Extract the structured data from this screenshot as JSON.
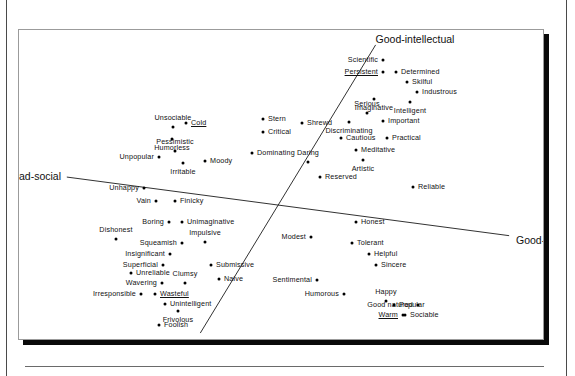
{
  "figure": {
    "kind": "multidimensional-scaling-scatter",
    "axis_labels": {
      "good_intellectual": "Good-intellectual",
      "bad_intellectual": "Bad-intellectual",
      "good_social": "Good-social",
      "bad_social": "Bad-social"
    }
  },
  "chart_data": {
    "type": "scatter",
    "title": "",
    "subtitle": "",
    "xlabel": "",
    "ylabel": "",
    "grid": false,
    "legend": "none",
    "xlim": [
      0,
      526
    ],
    "ylim": [
      0,
      311
    ],
    "note": "Two oblique reference axes are drawn: a social axis running from Bad-social (upper left) to Good-social (lower right), and an intellectual axis running from Good-intellectual (upper right) to Bad-intellectual (lower left). Coordinates below are plot-box pixel positions of each labelled trait dot.",
    "axes": [
      {
        "name": "social-axis",
        "negative_label": "Bad-social",
        "positive_label": "Good-social",
        "x1": 48,
        "y1": 148,
        "x2": 492,
        "y2": 207
      },
      {
        "name": "intellectual-axis",
        "negative_label": "Bad-intellectual",
        "positive_label": "Good-intellectual",
        "x1": 182,
        "y1": 305,
        "x2": 358,
        "y2": 15
      }
    ],
    "axis_end_labels": [
      {
        "name": "Good-intellectual",
        "x": 396,
        "y": 9,
        "align": "ctr-x"
      },
      {
        "name": "Bad-social",
        "x": 42,
        "y": 146,
        "align": "end-l"
      },
      {
        "name": "Good-social",
        "x": 497,
        "y": 210,
        "align": "end-r"
      },
      {
        "name": "Bad-intellectual",
        "x": 176,
        "y": 313,
        "align": "ctr-x"
      }
    ],
    "points": [
      {
        "label": "Scientific",
        "x": 364,
        "y": 30,
        "pos": "right",
        "underline": false
      },
      {
        "label": "Persistent",
        "x": 364,
        "y": 42,
        "pos": "right",
        "underline": true
      },
      {
        "label": "Determined",
        "x": 377,
        "y": 42,
        "pos": "left",
        "underline": false
      },
      {
        "label": "Skilful",
        "x": 388,
        "y": 52,
        "pos": "left",
        "underline": false
      },
      {
        "label": "Industrous",
        "x": 398,
        "y": 62,
        "pos": "left",
        "underline": false
      },
      {
        "label": "Imaginative",
        "x": 355,
        "y": 69,
        "pos": "below",
        "underline": false
      },
      {
        "label": "Intelligent",
        "x": 391,
        "y": 72,
        "pos": "below",
        "underline": false
      },
      {
        "label": "Serious",
        "x": 348,
        "y": 83,
        "pos": "above",
        "underline": false
      },
      {
        "label": "Important",
        "x": 364,
        "y": 91,
        "pos": "left",
        "underline": false
      },
      {
        "label": "Discriminating",
        "x": 330,
        "y": 92,
        "pos": "below",
        "underline": false
      },
      {
        "label": "Cautious",
        "x": 322,
        "y": 108,
        "pos": "left",
        "underline": false
      },
      {
        "label": "Practical",
        "x": 368,
        "y": 108,
        "pos": "left",
        "underline": false
      },
      {
        "label": "Meditative",
        "x": 337,
        "y": 120,
        "pos": "left",
        "underline": false
      },
      {
        "label": "Artistic",
        "x": 344,
        "y": 130,
        "pos": "below",
        "underline": false
      },
      {
        "label": "Reserved",
        "x": 301,
        "y": 147,
        "pos": "left",
        "underline": false
      },
      {
        "label": "Reliable",
        "x": 394,
        "y": 157,
        "pos": "left",
        "underline": false
      },
      {
        "label": "Stern",
        "x": 244,
        "y": 89,
        "pos": "left",
        "underline": false
      },
      {
        "label": "Shrewd",
        "x": 283,
        "y": 93,
        "pos": "left",
        "underline": false
      },
      {
        "label": "Critical",
        "x": 244,
        "y": 102,
        "pos": "left",
        "underline": false
      },
      {
        "label": "Dominating",
        "x": 233,
        "y": 123,
        "pos": "left",
        "underline": false
      },
      {
        "label": "Daring",
        "x": 289,
        "y": 132,
        "pos": "above",
        "underline": false
      },
      {
        "label": "Unsociable",
        "x": 154,
        "y": 97,
        "pos": "above",
        "underline": false
      },
      {
        "label": "Cold",
        "x": 167,
        "y": 93,
        "pos": "left",
        "underline": true
      },
      {
        "label": "Humorless",
        "x": 153,
        "y": 109,
        "pos": "below",
        "underline": false
      },
      {
        "label": "Pessimistic",
        "x": 156,
        "y": 121,
        "pos": "above",
        "underline": false
      },
      {
        "label": "Unpopular",
        "x": 140,
        "y": 127,
        "pos": "right",
        "underline": false
      },
      {
        "label": "Irritable",
        "x": 164,
        "y": 133,
        "pos": "below",
        "underline": false
      },
      {
        "label": "Moody",
        "x": 186,
        "y": 131,
        "pos": "left",
        "underline": false
      },
      {
        "label": "Unhappy",
        "x": 125,
        "y": 158,
        "pos": "right",
        "underline": false
      },
      {
        "label": "Vain",
        "x": 137,
        "y": 171,
        "pos": "right",
        "underline": false
      },
      {
        "label": "Finicky",
        "x": 156,
        "y": 171,
        "pos": "left",
        "underline": false
      },
      {
        "label": "Boring",
        "x": 150,
        "y": 192,
        "pos": "right",
        "underline": false
      },
      {
        "label": "Unimaginative",
        "x": 163,
        "y": 192,
        "pos": "left",
        "underline": false
      },
      {
        "label": "Dishonest",
        "x": 97,
        "y": 209,
        "pos": "above",
        "underline": false
      },
      {
        "label": "Squeamish",
        "x": 163,
        "y": 213,
        "pos": "right",
        "underline": false
      },
      {
        "label": "Impulsive",
        "x": 186,
        "y": 212,
        "pos": "above",
        "underline": false
      },
      {
        "label": "Insignificant",
        "x": 151,
        "y": 224,
        "pos": "right",
        "underline": false
      },
      {
        "label": "Superficial",
        "x": 144,
        "y": 235,
        "pos": "right",
        "underline": false
      },
      {
        "label": "Submissive",
        "x": 192,
        "y": 235,
        "pos": "left",
        "underline": false
      },
      {
        "label": "Unreliable",
        "x": 112,
        "y": 243,
        "pos": "left",
        "underline": false
      },
      {
        "label": "Clumsy",
        "x": 166,
        "y": 253,
        "pos": "above",
        "underline": false
      },
      {
        "label": "Wavering",
        "x": 143,
        "y": 253,
        "pos": "right",
        "underline": false
      },
      {
        "label": "Naive",
        "x": 200,
        "y": 249,
        "pos": "left",
        "underline": false
      },
      {
        "label": "Irresponsible",
        "x": 122,
        "y": 264,
        "pos": "right",
        "underline": false
      },
      {
        "label": "Wasteful",
        "x": 136,
        "y": 264,
        "pos": "left",
        "underline": true
      },
      {
        "label": "Unintelligent",
        "x": 146,
        "y": 274,
        "pos": "left",
        "underline": false
      },
      {
        "label": "Frivolous",
        "x": 159,
        "y": 281,
        "pos": "below",
        "underline": false
      },
      {
        "label": "Foolish",
        "x": 140,
        "y": 295,
        "pos": "left",
        "underline": false
      },
      {
        "label": "Honest",
        "x": 337,
        "y": 192,
        "pos": "left",
        "underline": false
      },
      {
        "label": "Modest",
        "x": 292,
        "y": 207,
        "pos": "right",
        "underline": false
      },
      {
        "label": "Tolerant",
        "x": 333,
        "y": 213,
        "pos": "left",
        "underline": false
      },
      {
        "label": "Helpful",
        "x": 350,
        "y": 224,
        "pos": "left",
        "underline": false
      },
      {
        "label": "Sincere",
        "x": 357,
        "y": 235,
        "pos": "left",
        "underline": false
      },
      {
        "label": "Sentimental",
        "x": 298,
        "y": 250,
        "pos": "right",
        "underline": false
      },
      {
        "label": "Humorous",
        "x": 325,
        "y": 264,
        "pos": "right",
        "underline": false
      },
      {
        "label": "Happy",
        "x": 367,
        "y": 271,
        "pos": "above",
        "underline": false
      },
      {
        "label": "Good natured",
        "x": 399,
        "y": 275,
        "pos": "right",
        "underline": false
      },
      {
        "label": "Popular",
        "x": 375,
        "y": 275,
        "pos": "left",
        "underline": false
      },
      {
        "label": "Warm",
        "x": 384,
        "y": 285,
        "pos": "right",
        "underline": true
      },
      {
        "label": "Sociable",
        "x": 386,
        "y": 285,
        "pos": "left",
        "underline": false
      }
    ]
  }
}
